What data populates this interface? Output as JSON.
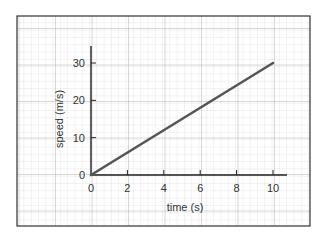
{
  "chart_data": {
    "type": "line",
    "title": "",
    "xlabel": "time (s)",
    "ylabel": "speed (m/s)",
    "x_ticks": [
      "0",
      "2",
      "4",
      "6",
      "8",
      "10"
    ],
    "y_ticks": [
      "0",
      "10",
      "20",
      "30"
    ],
    "xlim": [
      0,
      10
    ],
    "ylim": [
      0,
      30
    ],
    "grid": true,
    "legend": null,
    "series": [
      {
        "name": "speed",
        "x": [
          0,
          10
        ],
        "y": [
          0,
          30
        ],
        "color": "#555555"
      }
    ]
  },
  "colors": {
    "grid": "#bdbdbd",
    "axis": "#222222",
    "line": "#555555",
    "frame": "#333333"
  }
}
